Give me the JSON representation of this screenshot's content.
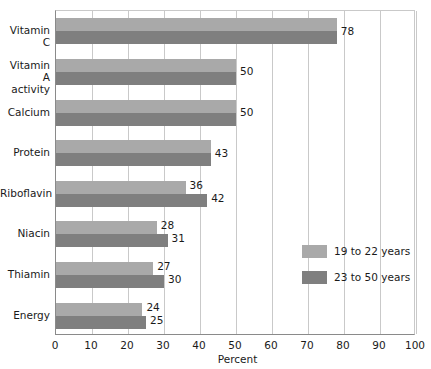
{
  "chart_data": {
    "type": "bar",
    "orientation": "horizontal",
    "title": "",
    "xlabel": "Percent",
    "ylabel": "",
    "xlim": [
      0,
      100
    ],
    "xticks": [
      0,
      10,
      20,
      30,
      40,
      50,
      60,
      70,
      80,
      90,
      100
    ],
    "grid": true,
    "legend_position": "right-middle",
    "categories": [
      "Vitamin C",
      "Vitamin A activity",
      "Calcium",
      "Protein",
      "Riboflavin",
      "Niacin",
      "Thiamin",
      "Energy"
    ],
    "category_lines": [
      [
        "Vitamin C"
      ],
      [
        "Vitamin A",
        "activity"
      ],
      [
        "Calcium"
      ],
      [
        "Protein"
      ],
      [
        "Riboflavin"
      ],
      [
        "Niacin"
      ],
      [
        "Thiamin"
      ],
      [
        "Energy"
      ]
    ],
    "series": [
      {
        "name": "19 to 22 years",
        "color": "#a9a9a9",
        "values": [
          78,
          50,
          50,
          43,
          36,
          28,
          27,
          24
        ]
      },
      {
        "name": "23 to 50 years",
        "color": "#7f7f7f",
        "values": [
          78,
          50,
          50,
          43,
          42,
          31,
          30,
          25
        ]
      }
    ],
    "value_labels": {
      "Vitamin C": [
        "78"
      ],
      "Vitamin A activity": [
        "50"
      ],
      "Calcium": [
        "50"
      ],
      "Protein": [
        "43"
      ],
      "Riboflavin": [
        "36",
        "42"
      ],
      "Niacin": [
        "28",
        "31"
      ],
      "Thiamin": [
        "27",
        "30"
      ],
      "Energy": [
        "24",
        "25"
      ]
    }
  },
  "legend": {
    "items": [
      {
        "label": "19 to 22 years",
        "color": "#a9a9a9"
      },
      {
        "label": "23 to 50 years",
        "color": "#7f7f7f"
      }
    ]
  },
  "axis": {
    "x_title": "Percent",
    "x_tick_labels": [
      "0",
      "10",
      "20",
      "30",
      "40",
      "50",
      "60",
      "70",
      "80",
      "90",
      "100"
    ]
  }
}
